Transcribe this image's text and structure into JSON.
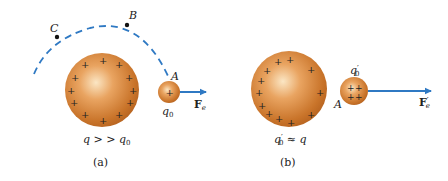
{
  "colors": {
    "sphere_base": "#c9742a",
    "sphere_highlight": "#f7d7a8",
    "sphere_edge": "#a85a1c",
    "path_dash": "#2f79c3",
    "arrow": "#2f79c3",
    "text": "#222222",
    "plus": "#2a1a10"
  },
  "panel_a": {
    "caption": "(a)",
    "source_label_q": "q",
    "source_label_rel": " > > ",
    "source_label_q0": "q",
    "source_label_q0_sub": "0",
    "point_A": "A",
    "point_B": "B",
    "point_C": "C",
    "test_charge_label": "q",
    "test_charge_sub": "0",
    "test_charge_sign": "+",
    "force_label": "F",
    "force_sub": "e",
    "plus_sign": "+"
  },
  "panel_b": {
    "caption": "(b)",
    "source_label_q0": "q",
    "source_label_q0_prime": "′",
    "source_label_q0_sub": "0",
    "source_label_rel": " ≈ ",
    "source_label_q": "q",
    "point_A": "A",
    "test_charge_label": "q",
    "test_charge_prime": "′",
    "test_charge_sub": "0",
    "force_label": "F",
    "force_prime": "′",
    "force_sub": "e",
    "plus_sign": "+"
  }
}
